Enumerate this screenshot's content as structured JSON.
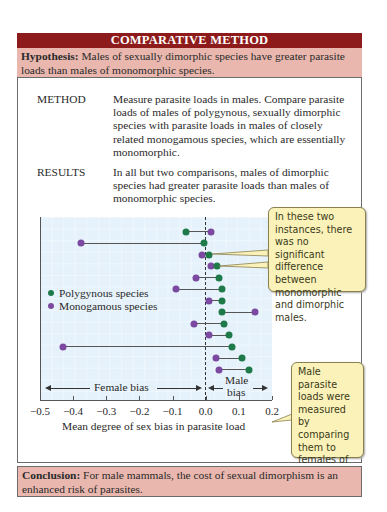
{
  "header": {
    "title": "COMPARATIVE METHOD"
  },
  "hypothesis": {
    "label": "Hypothesis:",
    "text": " Males of sexually dimorphic species have greater parasite loads than males of monomorphic species."
  },
  "method": {
    "label": "METHOD",
    "text": "Measure parasite loads in males. Compare parasite loads of males of polygynous, sexually dimorphic species with parasite loads in males of closely related monogamous species, which are essentially monomorphic."
  },
  "results": {
    "label": "RESULTS",
    "text": "In all but two comparisons, males of dimorphic species had greater parasite loads than males of monomorphic species."
  },
  "legend": {
    "polygynous": "Polygynous species",
    "monogamous": "Monogamous species"
  },
  "bias_labels": {
    "female": "Female bias",
    "male_line1": "Male",
    "male_line2": "bias"
  },
  "callouts": {
    "no_difference": "In these two instances, there was no significant difference between monomorphic and dimorphic males.",
    "measurement": "Male parasite loads were measured by comparing them to females of the same species."
  },
  "conclusion": {
    "label": "Conclusion:",
    "text": " For male mammals, the cost of sexual dimorphism is an enhanced risk of parasites."
  },
  "colors": {
    "header_bg": "#8e1b1b",
    "hypothesis_bg": "#e9b7ae",
    "polygynous": "#1f7a4a",
    "monogamous": "#7b4aa0",
    "plot_bg": "#e6f2fb",
    "callout_bg": "#faf2b8"
  },
  "chart_data": {
    "type": "scatter",
    "subtype": "dumbbell",
    "title": "",
    "xlabel": "Mean degree of sex bias in parasite load",
    "ylabel": "",
    "xlim": [
      -0.5,
      0.2
    ],
    "xticks": [
      "-0.5",
      "-0.4",
      "-0.3",
      "-0.2",
      "-0.1",
      "0.0",
      "0.1",
      "0.2"
    ],
    "grid": true,
    "legend_position": "left-middle",
    "series": [
      {
        "name": "Polygynous species",
        "color": "#1f7a4a",
        "values": [
          -0.06,
          -0.005,
          0.01,
          0.035,
          0.04,
          0.05,
          0.05,
          0.05,
          0.055,
          0.07,
          0.08,
          0.11,
          0.13
        ]
      },
      {
        "name": "Monogamous species",
        "color": "#7b4aa0",
        "values": [
          0.015,
          -0.375,
          -0.01,
          0.015,
          -0.03,
          -0.09,
          0.01,
          0.15,
          -0.035,
          0.01,
          -0.43,
          0.03,
          0.04
        ]
      }
    ],
    "annotations": [
      "Female bias (left of 0)",
      "Male bias (right of 0)",
      "Rows 3 and 4: no significant difference"
    ]
  }
}
